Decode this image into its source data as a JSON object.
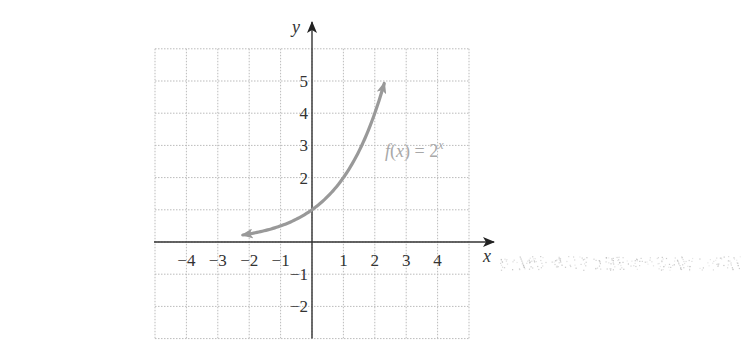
{
  "chart_data": {
    "type": "line",
    "title": "",
    "function_label": "f(x) = 2^x",
    "function_label_parts": {
      "pre": "f(x) = 2",
      "sup": "x"
    },
    "xlabel": "x",
    "ylabel": "y",
    "xlim": [
      -5,
      5
    ],
    "ylim": [
      -3,
      6
    ],
    "grid": true,
    "grid_style": "dotted",
    "x_ticks": [
      -4,
      -3,
      -2,
      -1,
      1,
      2,
      3,
      4
    ],
    "x_tick_labels": [
      "−4",
      "−3",
      "−2",
      "−1",
      "1",
      "2",
      "3",
      "4"
    ],
    "y_ticks": [
      5,
      4,
      3,
      2,
      -1,
      -2
    ],
    "y_tick_labels": [
      "5",
      "4",
      "3",
      "2",
      "−1",
      "−2"
    ],
    "series": [
      {
        "name": "f(x) = 2^x",
        "x": [
          -2.2,
          -2,
          -1,
          0,
          1,
          2,
          2.3
        ],
        "y": [
          0.22,
          0.25,
          0.5,
          1,
          2,
          4,
          4.92
        ],
        "arrows": "both",
        "color": "#999999"
      }
    ],
    "colors": {
      "curve": "#999999",
      "axis": "#333333",
      "grid": "#bbbbbb",
      "label": "#a8a8a8"
    }
  }
}
